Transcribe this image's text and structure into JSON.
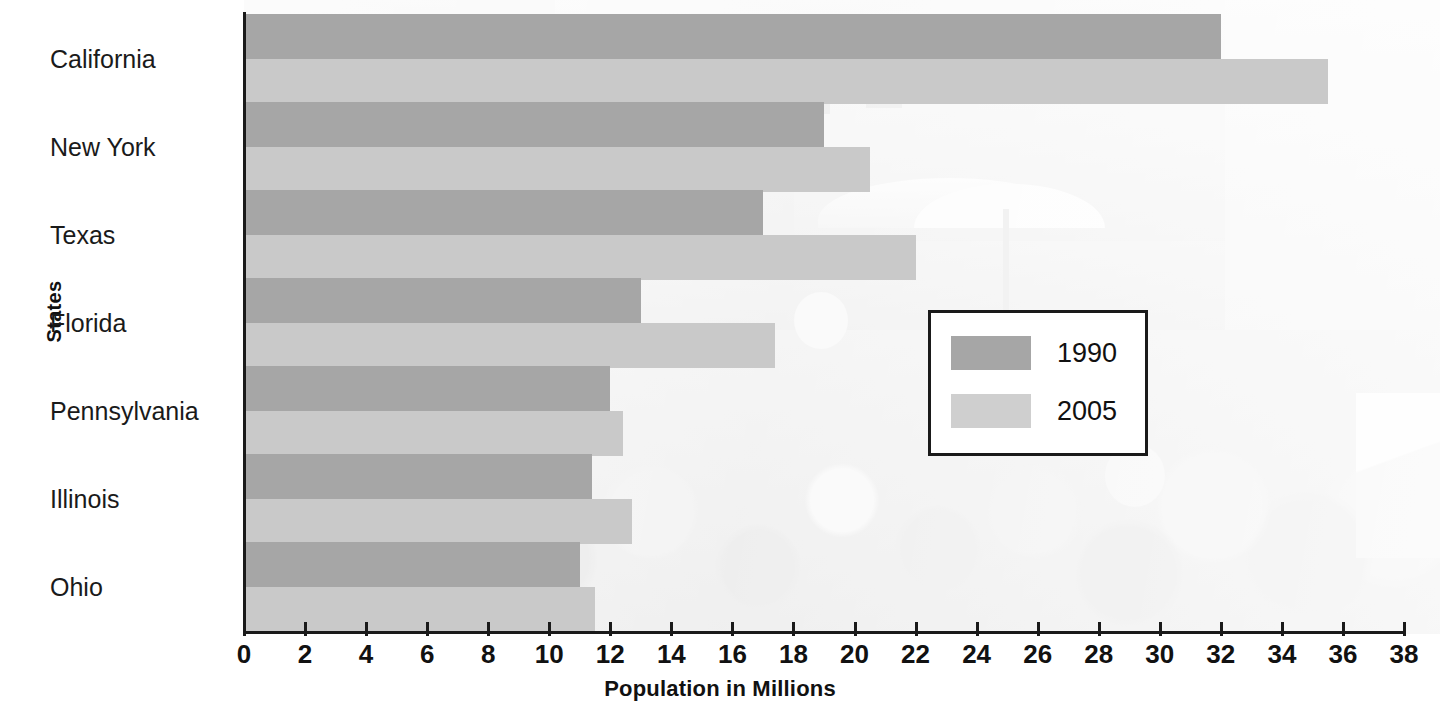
{
  "chart_data": {
    "type": "bar",
    "orientation": "horizontal",
    "title": "",
    "xlabel": "Population in Millions",
    "ylabel": "States",
    "categories": [
      "California",
      "New York",
      "Texas",
      "Florida",
      "Pennsylvania",
      "Illinois",
      "Ohio"
    ],
    "series": [
      {
        "name": "1990",
        "color": "#a6a6a6",
        "values": [
          32,
          19,
          17,
          13,
          12,
          11.4,
          11
        ]
      },
      {
        "name": "2005",
        "color": "#c9c9c9",
        "values": [
          35.5,
          20.5,
          22,
          17.4,
          12.4,
          12.7,
          11.5
        ]
      }
    ],
    "xlim": [
      0,
      38
    ],
    "xticks": [
      0,
      2,
      4,
      6,
      8,
      10,
      12,
      14,
      16,
      18,
      20,
      22,
      24,
      26,
      28,
      30,
      32,
      34,
      36,
      38
    ],
    "xtick_labels": [
      "0",
      "2",
      "4",
      "6",
      "8",
      "10",
      "12",
      "14",
      "16",
      "18",
      "20",
      "22",
      "24",
      "26",
      "28",
      "30",
      "32",
      "34",
      "36",
      "38"
    ],
    "grid": false,
    "legend": {
      "position": "middle-right",
      "entries": [
        "1990",
        "2005"
      ]
    }
  },
  "background": {
    "description": "faded photograph of a crowded city street behind the plot area"
  }
}
